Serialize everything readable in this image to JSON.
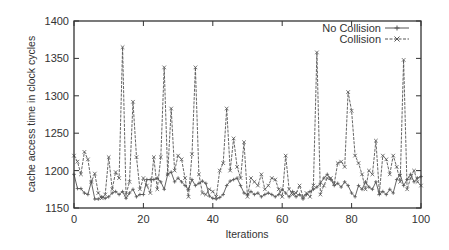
{
  "chart_data": {
    "type": "line",
    "title": "",
    "xlabel": "Iterations",
    "ylabel": "cache access time in clock cycles",
    "xlim": [
      0,
      100
    ],
    "ylim": [
      1150,
      1400
    ],
    "x_ticks": [
      0,
      20,
      40,
      60,
      80,
      100
    ],
    "y_ticks": [
      1150,
      1200,
      1250,
      1300,
      1350,
      1400
    ],
    "grid": false,
    "legend_position": "top-right",
    "series": [
      {
        "name": "No Collision",
        "marker": "+",
        "color": "#555555",
        "x": [
          0,
          1,
          2,
          3,
          4,
          5,
          6,
          7,
          8,
          9,
          10,
          11,
          12,
          13,
          14,
          15,
          16,
          17,
          18,
          19,
          20,
          21,
          22,
          23,
          24,
          25,
          26,
          27,
          28,
          29,
          30,
          31,
          32,
          33,
          34,
          35,
          36,
          37,
          38,
          39,
          40,
          41,
          42,
          43,
          44,
          45,
          46,
          47,
          48,
          49,
          50,
          51,
          52,
          53,
          54,
          55,
          56,
          57,
          58,
          59,
          60,
          61,
          62,
          63,
          64,
          65,
          66,
          67,
          68,
          69,
          70,
          71,
          72,
          73,
          74,
          75,
          76,
          77,
          78,
          79,
          80,
          81,
          82,
          83,
          84,
          85,
          86,
          87,
          88,
          89,
          90,
          91,
          92,
          93,
          94,
          95,
          96,
          97,
          98,
          99,
          100
        ],
        "values": [
          1195,
          1176,
          1176,
          1170,
          1168,
          1185,
          1162,
          1162,
          1165,
          1163,
          1165,
          1170,
          1172,
          1168,
          1172,
          1163,
          1170,
          1175,
          1165,
          1168,
          1168,
          1188,
          1188,
          1188,
          1190,
          1185,
          1175,
          1195,
          1198,
          1185,
          1190,
          1185,
          1180,
          1175,
          1188,
          1180,
          1183,
          1186,
          1183,
          1166,
          1163,
          1162,
          1164,
          1168,
          1180,
          1186,
          1188,
          1190,
          1180,
          1170,
          1168,
          1172,
          1168,
          1170,
          1165,
          1168,
          1170,
          1168,
          1165,
          1168,
          1175,
          1170,
          1165,
          1172,
          1165,
          1168,
          1162,
          1168,
          1172,
          1175,
          1178,
          1183,
          1190,
          1195,
          1188,
          1180,
          1183,
          1178,
          1185,
          1180,
          1170,
          1165,
          1180,
          1175,
          1185,
          1178,
          1175,
          1185,
          1168,
          1172,
          1168,
          1175,
          1170,
          1188,
          1195,
          1180,
          1188,
          1195,
          1185,
          1190,
          1192
        ]
      },
      {
        "name": "Collision",
        "marker": "x",
        "color": "#555555",
        "x": [
          0,
          1,
          2,
          3,
          4,
          5,
          6,
          7,
          8,
          9,
          10,
          11,
          12,
          13,
          14,
          15,
          16,
          17,
          18,
          19,
          20,
          21,
          22,
          23,
          24,
          25,
          26,
          27,
          28,
          29,
          30,
          31,
          32,
          33,
          34,
          35,
          36,
          37,
          38,
          39,
          40,
          41,
          42,
          43,
          44,
          45,
          46,
          47,
          48,
          49,
          50,
          51,
          52,
          53,
          54,
          55,
          56,
          57,
          58,
          59,
          60,
          61,
          62,
          63,
          64,
          65,
          66,
          67,
          68,
          69,
          70,
          71,
          72,
          73,
          74,
          75,
          76,
          77,
          78,
          79,
          80,
          81,
          82,
          83,
          84,
          85,
          86,
          87,
          88,
          89,
          90,
          91,
          92,
          93,
          94,
          95,
          96,
          97,
          98,
          99,
          100
        ],
        "values": [
          1220,
          1212,
          1195,
          1225,
          1215,
          1185,
          1196,
          1170,
          1163,
          1168,
          1218,
          1175,
          1198,
          1190,
          1365,
          1168,
          1185,
          1292,
          1218,
          1175,
          1190,
          1180,
          1170,
          1218,
          1175,
          1218,
          1338,
          1195,
          1283,
          1200,
          1220,
          1215,
          1190,
          1165,
          1222,
          1338,
          1195,
          1170,
          1168,
          1175,
          1172,
          1165,
          1200,
          1210,
          1283,
          1200,
          1243,
          1205,
          1190,
          1238,
          1165,
          1190,
          1185,
          1180,
          1195,
          1175,
          1180,
          1190,
          1188,
          1175,
          1165,
          1220,
          1175,
          1168,
          1170,
          1180,
          1165,
          1170,
          1165,
          1180,
          1358,
          1168,
          1180,
          1190,
          1190,
          1183,
          1210,
          1212,
          1205,
          1305,
          1280,
          1220,
          1210,
          1195,
          1175,
          1200,
          1195,
          1240,
          1170,
          1220,
          1215,
          1195,
          1220,
          1205,
          1185,
          1348,
          1175,
          1190,
          1200,
          1185,
          1180
        ]
      }
    ]
  },
  "legend": {
    "items": [
      {
        "label": "No Collision",
        "marker": "+"
      },
      {
        "label": "Collision",
        "marker": "x"
      }
    ]
  }
}
